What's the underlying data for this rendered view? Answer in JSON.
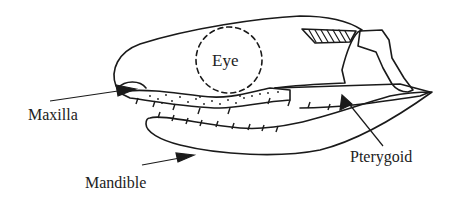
{
  "diagram": {
    "labels": {
      "eye": "Eye",
      "maxilla": "Maxilla",
      "mandible": "Mandible",
      "pterygoid": "Pterygoid"
    },
    "colors": {
      "line": "#1a1a1a",
      "text": "#222222",
      "background": "#ffffff"
    }
  }
}
